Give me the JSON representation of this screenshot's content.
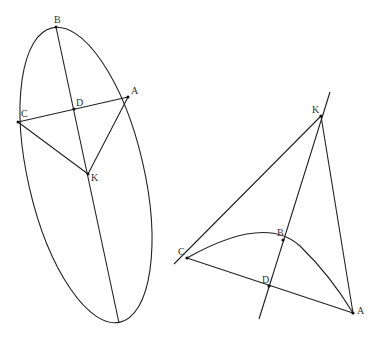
{
  "figures": [
    {
      "id": "left",
      "description": "Ellipse with chord CA, diameter B-bottom, and segments CK, AK",
      "points": {
        "B": {
          "label": "B",
          "x": 56,
          "y": 27
        },
        "A": {
          "label": "A",
          "x": 128,
          "y": 97
        },
        "C": {
          "label": "C",
          "x": 18,
          "y": 122
        },
        "D": {
          "label": "D",
          "x": 74,
          "y": 109
        },
        "K": {
          "label": "K",
          "x": 88,
          "y": 174
        }
      }
    },
    {
      "id": "right",
      "description": "Parabolic arc CBA with chord CA, lines through K to C, B/D and A",
      "points": {
        "K": {
          "label": "K",
          "x": 321,
          "y": 116
        },
        "C": {
          "label": "C",
          "x": 187,
          "y": 258
        },
        "B": {
          "label": "B",
          "x": 283,
          "y": 240
        },
        "D": {
          "label": "D",
          "x": 269,
          "y": 286
        },
        "A": {
          "label": "A",
          "x": 353,
          "y": 313
        }
      }
    }
  ],
  "colors": {
    "stroke": "#222222",
    "background": "#ffffff"
  }
}
